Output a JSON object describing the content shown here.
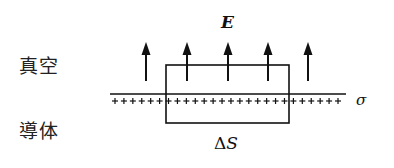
{
  "diagram": {
    "type": "gauss-pillbox-conductor-surface",
    "labels": {
      "vacuum": "真空",
      "conductor": "導体",
      "field": "E",
      "surface_charge": "σ",
      "area_delta": "Δ",
      "area_symbol": "S"
    },
    "colors": {
      "ink": "#111111",
      "background": "#ffffff"
    },
    "surface": {
      "y": 94,
      "x_start": 110,
      "x_end": 346
    },
    "charges": {
      "sign": "+",
      "y": 101,
      "x_start": 115,
      "x_end": 338,
      "count": 26
    },
    "pillbox": {
      "x": 166,
      "y": 65,
      "width": 123,
      "height": 58
    },
    "arrows": {
      "x_positions": [
        146,
        187,
        228,
        268,
        308
      ],
      "y_tip": 42,
      "y_base": 81
    }
  }
}
